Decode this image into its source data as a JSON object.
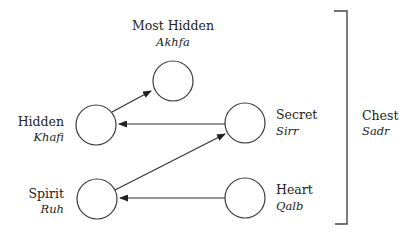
{
  "diagram": {
    "type": "latifa-hierarchy",
    "nodes": [
      {
        "id": "akhfa",
        "label": "Most Hidden",
        "sublabel": "Akhfa",
        "cx": 173,
        "cy": 81,
        "r": 20
      },
      {
        "id": "khafi",
        "label": "Hidden",
        "sublabel": "Khafi",
        "cx": 96,
        "cy": 125,
        "r": 20
      },
      {
        "id": "sirr",
        "label": "Secret",
        "sublabel": "Sirr",
        "cx": 245,
        "cy": 123,
        "r": 20
      },
      {
        "id": "ruh",
        "label": "Spirit",
        "sublabel": "Ruh",
        "cx": 97,
        "cy": 199,
        "r": 20
      },
      {
        "id": "qalb",
        "label": "Heart",
        "sublabel": "Qalb",
        "cx": 245,
        "cy": 198,
        "r": 20
      }
    ],
    "edges": [
      {
        "from": "khafi",
        "to": "akhfa"
      },
      {
        "from": "sirr",
        "to": "khafi"
      },
      {
        "from": "ruh",
        "to": "sirr"
      },
      {
        "from": "qalb",
        "to": "ruh"
      }
    ],
    "group": {
      "label": "Chest",
      "sublabel": "Sadr"
    }
  },
  "colors": {
    "stroke": "#333333",
    "text": "#222222",
    "background": "#ffffff"
  }
}
